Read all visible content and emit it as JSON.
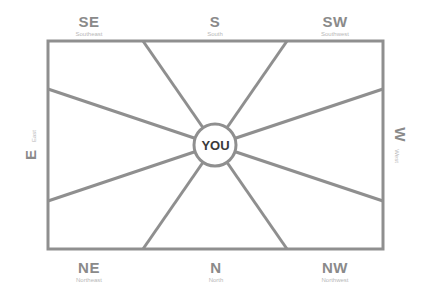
{
  "center": {
    "label": "YOU"
  },
  "directions": {
    "se": {
      "abbr": "SE",
      "full": "Southeast"
    },
    "s": {
      "abbr": "S",
      "full": "South"
    },
    "sw": {
      "abbr": "SW",
      "full": "Southwest"
    },
    "e": {
      "abbr": "E",
      "full": "East"
    },
    "w": {
      "abbr": "W",
      "full": "West"
    },
    "ne": {
      "abbr": "NE",
      "full": "Northeast"
    },
    "n": {
      "abbr": "N",
      "full": "North"
    },
    "nw": {
      "abbr": "NW",
      "full": "Northwest"
    }
  },
  "colors": {
    "line": "#8f8f8f",
    "label": "#8a8a8a",
    "sublabel": "#b8b8b8",
    "center_text": "#3a3a3a"
  }
}
